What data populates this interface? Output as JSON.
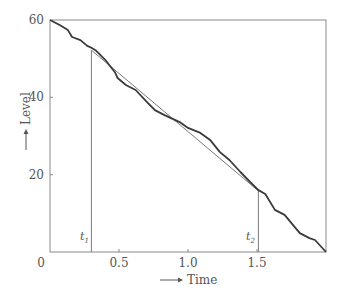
{
  "chart_data": {
    "type": "line",
    "title": "",
    "xlabel": "Time",
    "ylabel": "Level",
    "xlim": [
      0,
      2.0
    ],
    "ylim": [
      0,
      60
    ],
    "grid": false,
    "legend": null,
    "x_ticks": [
      {
        "value": 0,
        "label": "0"
      },
      {
        "value": 0.5,
        "label": "0.5"
      },
      {
        "value": 1.0,
        "label": "1.0"
      },
      {
        "value": 1.5,
        "label": "1.5"
      }
    ],
    "y_ticks": [
      {
        "value": 20,
        "label": "20"
      },
      {
        "value": 40,
        "label": "40"
      },
      {
        "value": 60,
        "label": "60"
      }
    ],
    "series": [
      {
        "name": "Level",
        "style": "thick-wavy",
        "x": [
          0,
          0.07,
          0.13,
          0.16,
          0.22,
          0.27,
          0.3,
          0.33,
          0.4,
          0.47,
          0.49,
          0.55,
          0.62,
          0.71,
          0.76,
          0.83,
          0.94,
          1.0,
          1.09,
          1.16,
          1.23,
          1.3,
          1.38,
          1.45,
          1.51,
          1.56,
          1.63,
          1.7,
          1.81,
          1.88,
          1.92,
          2.0
        ],
        "y": [
          60,
          58.7,
          57.4,
          55.6,
          54.8,
          53.3,
          52.8,
          52.2,
          49.7,
          46.5,
          45.0,
          43.2,
          41.9,
          38.5,
          36.7,
          35.4,
          33.6,
          32.1,
          30.8,
          29.0,
          25.9,
          23.8,
          20.7,
          18.1,
          16.0,
          15.0,
          10.9,
          9.6,
          4.9,
          3.6,
          3.1,
          0
        ]
      },
      {
        "name": "Trend",
        "style": "thin-straight",
        "x": [
          0.3,
          1.51
        ],
        "y": [
          52.2,
          15.8
        ]
      }
    ],
    "annotations": [
      {
        "type": "vline",
        "x": 0.3,
        "y_top": 52.2,
        "label": "t",
        "subscript": "1"
      },
      {
        "type": "vline",
        "x": 1.51,
        "y_top": 15.8,
        "label": "t",
        "subscript": "2"
      }
    ]
  },
  "labels": {
    "x_axis": "Time",
    "y_axis": "Level",
    "t1": "t",
    "t1_sub": "1",
    "t2": "t",
    "t2_sub": "2",
    "origin": "0"
  },
  "colors": {
    "frame": "#8a8a8a",
    "curve": "#3a3a3a",
    "trend": "#7a7a7a",
    "text": "#555555"
  }
}
